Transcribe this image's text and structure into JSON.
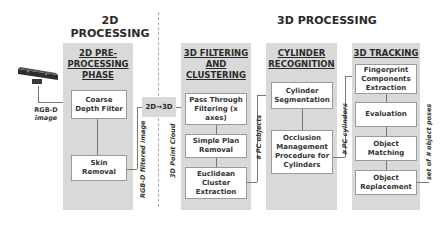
{
  "sections": {
    "left_title": "2D PROCESSING",
    "right_title": "3D PROCESSING"
  },
  "input": {
    "device_icon": "kinect-sensor-icon",
    "label_line1": "RGB-D",
    "label_line2": "image"
  },
  "panels": [
    {
      "title": "2D PRE-PROCESSING PHASE",
      "title_lines": [
        "2D PRE-",
        "PROCESSING",
        "PHASE"
      ],
      "steps": [
        "Coarse Depth Filter",
        "Skin Removal"
      ]
    },
    {
      "title": "3D FILTERING AND CLUSTERING",
      "title_lines": [
        "3D FILTERING",
        "AND",
        "CLUSTERING"
      ],
      "steps": [
        "Pass Through Filtering (x axes)",
        "Simple Plan Removal",
        "Euclidean Cluster Extraction"
      ]
    },
    {
      "title": "CYLINDER RECOGNITION",
      "title_lines": [
        "CYLINDER",
        "RECOGNITION"
      ],
      "steps": [
        "Cylinder Segmentation",
        "Occlusion Management Procedure for Cylinders"
      ]
    },
    {
      "title": "3D TRACKING",
      "title_lines": [
        "3D TRACKING"
      ],
      "steps": [
        "Fingerprint Components Extraction",
        "Evaluation",
        "Object Matching",
        "Object Replacement"
      ]
    }
  ],
  "converter": {
    "label": "2D→3D"
  },
  "edge_labels": {
    "filtered": "RGB-D filtered image",
    "point_cloud": "3D Point Cloud",
    "pc_objects": "# PC objects",
    "pc_cylinders": "# PC cylinders",
    "object_poses": "set of # object poses"
  },
  "colors": {
    "panel_bg": "#d9d9d9",
    "box_bg": "#ffffff",
    "line": "#777777"
  }
}
